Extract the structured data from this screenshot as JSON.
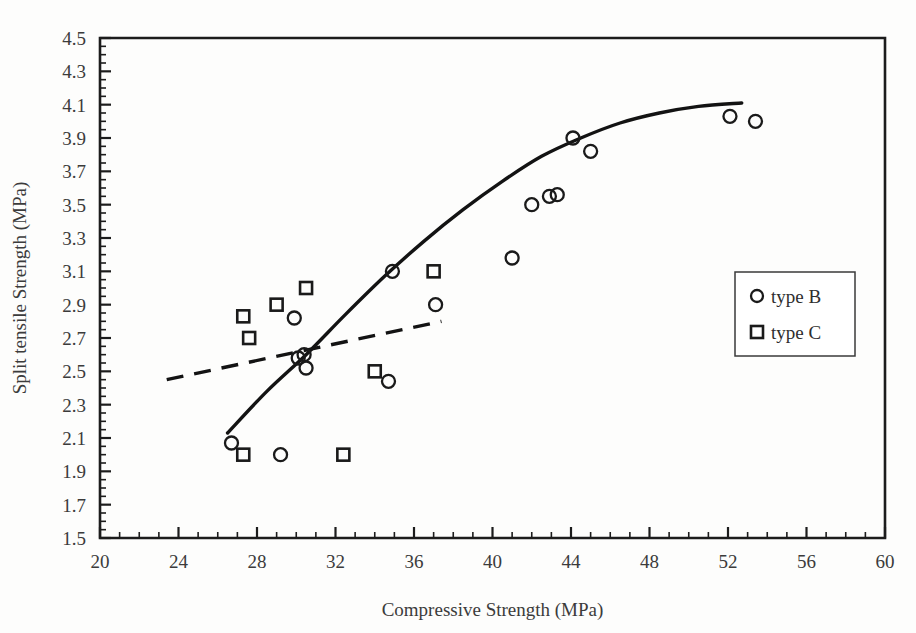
{
  "chart_data": {
    "type": "scatter",
    "title": "",
    "xlabel": "Compressive Strength (MPa)",
    "ylabel": "Split tensile Strength (MPa)",
    "xlim": [
      20,
      60
    ],
    "ylim": [
      1.5,
      4.5
    ],
    "xticks": [
      20,
      24,
      28,
      32,
      36,
      40,
      44,
      48,
      52,
      56,
      60
    ],
    "yticks": [
      1.5,
      1.7,
      1.9,
      2.1,
      2.3,
      2.5,
      2.7,
      2.9,
      3.1,
      3.3,
      3.5,
      3.7,
      3.9,
      4.1,
      4.3,
      4.5
    ],
    "xtick_labels": [
      "20",
      "24",
      "28",
      "32",
      "36",
      "40",
      "44",
      "48",
      "52",
      "56",
      "60"
    ],
    "ytick_labels": [
      "1.5",
      "1.7",
      "1.9",
      "2.1",
      "2.3",
      "2.5",
      "2.7",
      "2.9",
      "3.1",
      "3.3",
      "3.5",
      "3.7",
      "3.9",
      "4.1",
      "4.3",
      "4.5"
    ],
    "grid": false,
    "minor_ticks": true,
    "legend_position": "right",
    "series": [
      {
        "name": "type B",
        "marker": "circle",
        "color": "#1a1a1a",
        "points": [
          [
            26.7,
            2.07
          ],
          [
            29.2,
            2.0
          ],
          [
            29.9,
            2.82
          ],
          [
            30.1,
            2.58
          ],
          [
            30.4,
            2.6
          ],
          [
            30.5,
            2.52
          ],
          [
            34.9,
            3.1
          ],
          [
            34.7,
            2.44
          ],
          [
            37.1,
            2.9
          ],
          [
            41.0,
            3.18
          ],
          [
            42.0,
            3.5
          ],
          [
            42.9,
            3.55
          ],
          [
            43.3,
            3.56
          ],
          [
            44.1,
            3.9
          ],
          [
            45.0,
            3.82
          ],
          [
            52.1,
            4.03
          ],
          [
            53.4,
            4.0
          ]
        ]
      },
      {
        "name": "type C",
        "marker": "square",
        "color": "#1a1a1a",
        "points": [
          [
            27.3,
            2.83
          ],
          [
            27.6,
            2.7
          ],
          [
            27.3,
            2.0
          ],
          [
            29.0,
            2.9
          ],
          [
            30.5,
            3.0
          ],
          [
            32.4,
            2.0
          ],
          [
            34.0,
            2.5
          ],
          [
            37.0,
            3.1
          ]
        ]
      }
    ],
    "fit_lines": [
      {
        "name": "type B trend",
        "style": "solid",
        "points": [
          [
            26.5,
            2.13
          ],
          [
            28.5,
            2.38
          ],
          [
            30.5,
            2.6
          ],
          [
            32.5,
            2.84
          ],
          [
            34.5,
            3.07
          ],
          [
            36.5,
            3.28
          ],
          [
            38.5,
            3.47
          ],
          [
            40.5,
            3.64
          ],
          [
            42.5,
            3.79
          ],
          [
            44.5,
            3.9
          ],
          [
            46.5,
            3.99
          ],
          [
            48.5,
            4.05
          ],
          [
            50.5,
            4.09
          ],
          [
            52.7,
            4.11
          ]
        ]
      },
      {
        "name": "type C trend",
        "style": "dashed",
        "points": [
          [
            23.4,
            2.45
          ],
          [
            37.4,
            2.8
          ]
        ]
      }
    ]
  },
  "legend": {
    "entries": [
      {
        "label": "type B",
        "marker": "circle"
      },
      {
        "label": "type C",
        "marker": "square"
      }
    ]
  }
}
